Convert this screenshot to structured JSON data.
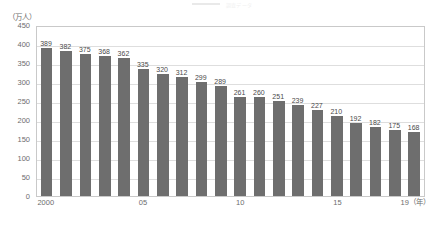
{
  "header": {
    "title": "調査データ",
    "swatch_name": "legend-swatch"
  },
  "axes": {
    "unit_label": "（万人）",
    "x_unit_suffix": "（年）",
    "y_ticks": [
      "450",
      "400",
      "350",
      "300",
      "250",
      "200",
      "150",
      "100",
      "50",
      "0"
    ],
    "x_tick_labels": [
      "2000",
      "05",
      "10",
      "15",
      "19（年）"
    ]
  },
  "style": {
    "bar_color": "#6e6e6e",
    "grid_color": "#dedede",
    "frame_color": "#c9c9c9",
    "label_color": "#4a4a4a",
    "axis_text_color": "#6d6d6d"
  },
  "chart_data": {
    "type": "bar",
    "title": "調査データ",
    "xlabel": "（年）",
    "ylabel": "（万人）",
    "ylim": [
      0,
      450
    ],
    "ytick_step": 50,
    "grid": true,
    "legend": false,
    "categories": [
      "2000",
      "2001",
      "2002",
      "2003",
      "2004",
      "2005",
      "2006",
      "2007",
      "2008",
      "2009",
      "2010",
      "2011",
      "2012",
      "2013",
      "2014",
      "2015",
      "2016",
      "2017",
      "2018",
      "2019"
    ],
    "labeled_xticks": [
      {
        "category": "2000",
        "label": "2000"
      },
      {
        "category": "2005",
        "label": "05"
      },
      {
        "category": "2010",
        "label": "10"
      },
      {
        "category": "2015",
        "label": "15"
      },
      {
        "category": "2019",
        "label": "19（年）"
      }
    ],
    "values": [
      389,
      382,
      375,
      368,
      362,
      335,
      320,
      312,
      299,
      289,
      261,
      260,
      251,
      239,
      227,
      210,
      192,
      182,
      175,
      168
    ],
    "bars": [
      {
        "category": "2000",
        "value": 389,
        "label": "389"
      },
      {
        "category": "2001",
        "value": 382,
        "label": "382"
      },
      {
        "category": "2002",
        "value": 375,
        "label": "375"
      },
      {
        "category": "2003",
        "value": 368,
        "label": "368"
      },
      {
        "category": "2004",
        "value": 362,
        "label": "362"
      },
      {
        "category": "2005",
        "value": 335,
        "label": "335"
      },
      {
        "category": "2006",
        "value": 320,
        "label": "320"
      },
      {
        "category": "2007",
        "value": 312,
        "label": "312"
      },
      {
        "category": "2008",
        "value": 299,
        "label": "299"
      },
      {
        "category": "2009",
        "value": 289,
        "label": "289"
      },
      {
        "category": "2010",
        "value": 261,
        "label": "261"
      },
      {
        "category": "2011",
        "value": 260,
        "label": "260"
      },
      {
        "category": "2012",
        "value": 251,
        "label": "251"
      },
      {
        "category": "2013",
        "value": 239,
        "label": "239"
      },
      {
        "category": "2014",
        "value": 227,
        "label": "227"
      },
      {
        "category": "2015",
        "value": 210,
        "label": "210"
      },
      {
        "category": "2016",
        "value": 192,
        "label": "192"
      },
      {
        "category": "2017",
        "value": 182,
        "label": "182"
      },
      {
        "category": "2018",
        "value": 175,
        "label": "175"
      },
      {
        "category": "2019",
        "value": 168,
        "label": "168"
      }
    ]
  }
}
